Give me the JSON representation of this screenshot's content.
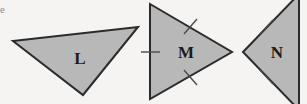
{
  "figure": {
    "kind": "geometry-diagram",
    "caption_fragment": "e",
    "width": 307,
    "height": 104,
    "background_color": "#f5f4f2",
    "fill_color": "#b8b8b8",
    "stroke_color": "#2b2b2b",
    "tick_color": "#4a4a4a",
    "label_color": "#1b1b1b",
    "stroke_width": 2,
    "tick_width": 1.4,
    "shapes": [
      {
        "id": "triangle-l",
        "label": "L",
        "label_x": 80,
        "label_y": 58,
        "points": "13,41 138,27 83,95",
        "tick_marks": [],
        "description": "scalene triangle, no congruence marks"
      },
      {
        "id": "triangle-m",
        "label": "M",
        "label_x": 186,
        "label_y": 52,
        "points": "150,4 232,52 150,99",
        "tick_marks": [
          {
            "id": "tick-m-left",
            "x1": 141,
            "y1": 52,
            "x2": 160,
            "y2": 52
          },
          {
            "id": "tick-m-top",
            "x1": 184,
            "y1": 34,
            "x2": 197,
            "y2": 19
          },
          {
            "id": "tick-m-bottom",
            "x1": 184,
            "y1": 70,
            "x2": 197,
            "y2": 85
          }
        ],
        "description": "isosceles-looking triangle apex right, one tick on each of three sides"
      },
      {
        "id": "triangle-n",
        "label": "N",
        "label_x": 277,
        "label_y": 52,
        "points": "243,52 299,-6 299,110",
        "tick_marks": [
          {
            "id": "tick-n-top",
            "x1": 260,
            "y1": 34,
            "x2": 273,
            "y2": 20
          },
          {
            "id": "tick-n-bottom",
            "x1": 260,
            "y1": 70,
            "x2": 273,
            "y2": 84
          }
        ],
        "description": "triangle apex left, cropped at right image edge, one tick on each slanted side"
      }
    ]
  }
}
